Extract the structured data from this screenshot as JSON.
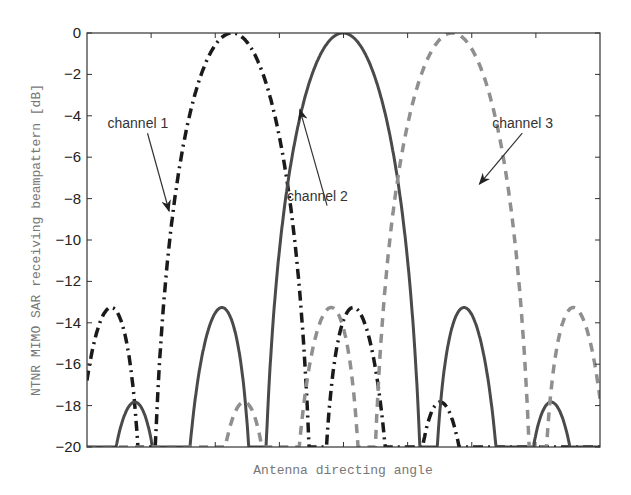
{
  "chart_data": {
    "type": "line",
    "title": "",
    "xlabel": "Antenna directing angle",
    "ylabel": "NTNR MIMO SAR receiving beampattern [dB]",
    "xlim": [
      0,
      1
    ],
    "ylim": [
      -20,
      0
    ],
    "yticks": [
      0,
      -2,
      -4,
      -6,
      -8,
      -10,
      -12,
      -14,
      -16,
      -18,
      -20
    ],
    "ytick_labels": [
      "0",
      "−2",
      "−4",
      "−6",
      "−8",
      "−10",
      "−12",
      "−14",
      "−16",
      "−18",
      "−20"
    ],
    "xticks": [
      0.375,
      0.5,
      0.625,
      0.125,
      0.25,
      0.75,
      0.875
    ],
    "grid": false,
    "x_tick_labels_shown": false,
    "pattern": {
      "null_spacing": 0.165,
      "floor_db": -20
    },
    "series": [
      {
        "name": "channel 1",
        "peak_x": 0.283,
        "style": "dashdot",
        "color": "#1a1a1a"
      },
      {
        "name": "channel 2",
        "peak_x": 0.499,
        "style": "solid",
        "color": "#4a4a4a"
      },
      {
        "name": "channel 3",
        "peak_x": 0.712,
        "style": "dashed",
        "color": "#8f8f8f"
      }
    ],
    "annotations": [
      {
        "text": "channel 1",
        "text_x": 0.04,
        "text_y": -4.6,
        "arrow_to_x": 0.16,
        "arrow_to_y": -8.6
      },
      {
        "text": "channel 2",
        "text_x": 0.39,
        "text_y": -8.1,
        "arrow_to_x": 0.415,
        "arrow_to_y": -3.7
      },
      {
        "text": "channel 3",
        "text_x": 0.79,
        "text_y": -4.6,
        "arrow_to_x": 0.765,
        "arrow_to_y": -7.3
      }
    ]
  }
}
